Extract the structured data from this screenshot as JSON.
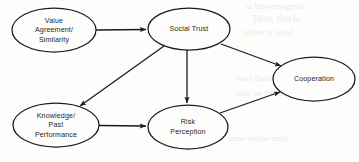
{
  "diagram": {
    "type": "path-diagram",
    "stroke_color": "#1b1b1b",
    "background_color": "#fdfdfc",
    "nodes": [
      {
        "id": "value-agreement",
        "label_lines": [
          "Value",
          "Agreement/",
          "Similarity"
        ],
        "line1": "Value",
        "line2": "Agreement/",
        "line3": "Similarity",
        "cx": 54,
        "cy": 30,
        "rx": 42,
        "ry": 22
      },
      {
        "id": "social-trust",
        "label_lines": [
          "Social Trust"
        ],
        "line1": "Social Trust",
        "cx": 189,
        "cy": 29,
        "rx": 41,
        "ry": 21
      },
      {
        "id": "cooperation",
        "label_lines": [
          "Cooperation"
        ],
        "line1": "Cooperation",
        "cx": 314,
        "cy": 79,
        "rx": 41,
        "ry": 22
      },
      {
        "id": "knowledge-past-performance",
        "label_lines": [
          "Knowledge/",
          "Past",
          "Performance"
        ],
        "line1": "Knowledge/",
        "line2": "Past",
        "line3": "Performance",
        "cx": 56,
        "cy": 125,
        "rx": 43,
        "ry": 22
      },
      {
        "id": "risk-perception",
        "label_lines": [
          "Risk",
          "Perception"
        ],
        "line1": "Risk",
        "line2": "Perception",
        "cx": 188,
        "cy": 127,
        "rx": 40,
        "ry": 22
      }
    ],
    "edges": [
      {
        "id": "value-agreement-to-social-trust",
        "from": "value-agreement",
        "to": "social-trust",
        "direction": "right"
      },
      {
        "id": "social-trust-to-knowledge",
        "from": "social-trust",
        "to": "knowledge-past-performance",
        "direction": "down-left"
      },
      {
        "id": "social-trust-to-risk-perception",
        "from": "social-trust",
        "to": "risk-perception",
        "direction": "down"
      },
      {
        "id": "social-trust-to-cooperation",
        "from": "social-trust",
        "to": "cooperation",
        "direction": "down-right"
      },
      {
        "id": "knowledge-to-risk-perception",
        "from": "knowledge-past-performance",
        "to": "risk-perception",
        "direction": "right"
      },
      {
        "id": "risk-perception-to-cooperation",
        "from": "risk-perception",
        "to": "cooperation",
        "direction": "up-right"
      }
    ]
  }
}
